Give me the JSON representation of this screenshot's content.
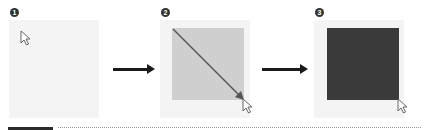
{
  "steps": [
    {
      "number": "1",
      "state": "empty canvas with pointer",
      "square_color": null
    },
    {
      "number": "2",
      "state": "drag selection diagonally",
      "square_color": "#cfcfcf"
    },
    {
      "number": "3",
      "state": "filled square",
      "square_color": "#3a3a3a"
    }
  ],
  "icons": {
    "cursor": "arrow-pointer-icon",
    "arrow": "right-arrow-icon"
  },
  "colors": {
    "panel_bg": "#f4f4f4",
    "selection": "#cfcfcf",
    "filled": "#3a3a3a",
    "arrow": "#1a1a1a"
  }
}
